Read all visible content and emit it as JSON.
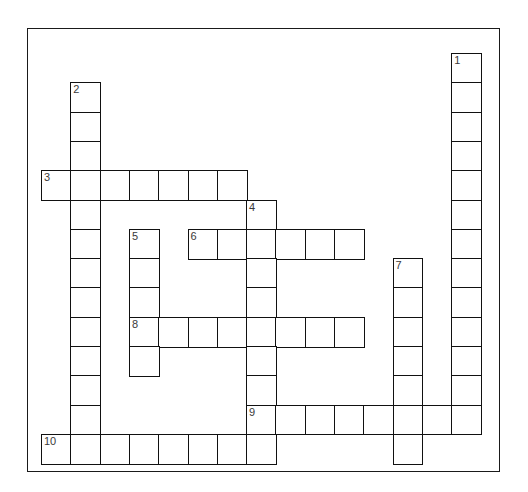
{
  "puzzle": {
    "kind": "crossword-grid",
    "title": "",
    "background_color": "#ffffff",
    "frame_color": "#1a1a1a",
    "cell_border_color": "#111111",
    "number_color": "#3a3a3a",
    "cell_size": 29.3,
    "origin_x": 41,
    "origin_y": 53,
    "frame": {
      "x": 27,
      "y": 28,
      "width": 473,
      "height": 444
    },
    "entry_count": 10,
    "entries": [
      {
        "number": "1",
        "direction": "down",
        "col": 14,
        "row": 0,
        "length": 13,
        "letters": ""
      },
      {
        "number": "2",
        "direction": "down",
        "col": 1,
        "row": 1,
        "length": 12,
        "letters": ""
      },
      {
        "number": "3",
        "direction": "across",
        "col": 0,
        "row": 4,
        "length": 7,
        "letters": ""
      },
      {
        "number": "4",
        "direction": "down",
        "col": 7,
        "row": 5,
        "length": 8,
        "letters": ""
      },
      {
        "number": "5",
        "direction": "down",
        "col": 3,
        "row": 6,
        "length": 5,
        "letters": ""
      },
      {
        "number": "6",
        "direction": "across",
        "col": 5,
        "row": 6,
        "length": 6,
        "letters": ""
      },
      {
        "number": "7",
        "direction": "down",
        "col": 12,
        "row": 7,
        "length": 7,
        "letters": ""
      },
      {
        "number": "8",
        "direction": "across",
        "col": 3,
        "row": 9,
        "length": 8,
        "letters": ""
      },
      {
        "number": "9",
        "direction": "across",
        "col": 7,
        "row": 12,
        "length": 8,
        "letters": ""
      },
      {
        "number": "10",
        "direction": "across",
        "col": 0,
        "row": 13,
        "length": 8,
        "letters": ""
      }
    ],
    "numbered_cells": [
      {
        "label": "1",
        "col": 14,
        "row": 0
      },
      {
        "label": "2",
        "col": 1,
        "row": 1
      },
      {
        "label": "3",
        "col": 0,
        "row": 4
      },
      {
        "label": "4",
        "col": 7,
        "row": 5
      },
      {
        "label": "5",
        "col": 3,
        "row": 6
      },
      {
        "label": "6",
        "col": 5,
        "row": 6
      },
      {
        "label": "7",
        "col": 12,
        "row": 7
      },
      {
        "label": "8",
        "col": 3,
        "row": 9
      },
      {
        "label": "9",
        "col": 7,
        "row": 12
      },
      {
        "label": "10",
        "col": 0,
        "row": 13
      }
    ]
  }
}
